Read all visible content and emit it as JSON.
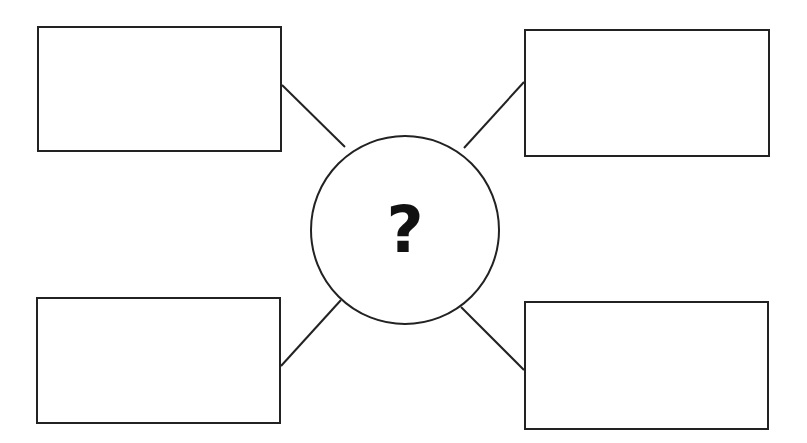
{
  "diagram": {
    "type": "spider-map",
    "center": {
      "label": "?",
      "cx": 405,
      "cy": 230,
      "r": 95
    },
    "boxes": [
      {
        "id": "top-left",
        "label": "",
        "x": 37,
        "y": 26,
        "w": 245,
        "h": 126
      },
      {
        "id": "top-right",
        "label": "",
        "x": 524,
        "y": 29,
        "w": 246,
        "h": 128
      },
      {
        "id": "bottom-left",
        "label": "",
        "x": 36,
        "y": 297,
        "w": 245,
        "h": 127
      },
      {
        "id": "bottom-right",
        "label": "",
        "x": 524,
        "y": 301,
        "w": 245,
        "h": 129
      }
    ],
    "connectors": [
      {
        "from": "top-left",
        "x1": 282,
        "y1": 85,
        "x2": 345,
        "y2": 147
      },
      {
        "from": "top-right",
        "x1": 524,
        "y1": 82,
        "x2": 464,
        "y2": 148
      },
      {
        "from": "bottom-left",
        "x1": 281,
        "y1": 366,
        "x2": 341,
        "y2": 300
      },
      {
        "from": "bottom-right",
        "x1": 524,
        "y1": 370,
        "x2": 461,
        "y2": 307
      }
    ],
    "colors": {
      "stroke": "#222222",
      "background": "#ffffff"
    }
  }
}
